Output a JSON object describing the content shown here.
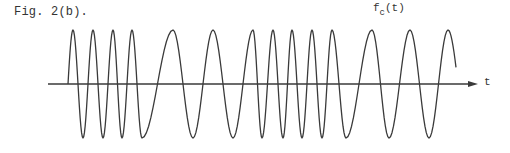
{
  "figure": {
    "caption": "Fig. 2(b).",
    "curve_label_main": "f",
    "curve_label_sub": "c",
    "curve_label_arg": "(t)",
    "axis_label": "t"
  },
  "chart_data": {
    "type": "line",
    "title": "Fig. 2(b).",
    "xlabel": "t",
    "ylabel": "",
    "series": [
      {
        "name": "f_c(t)",
        "description": "Frequency-modulated carrier: alternating fast and slow oscillations of constant amplitude",
        "start_point": [
          68,
          84
        ],
        "extrema_px": [
          [
            73,
            30
          ],
          [
            83,
            138
          ],
          [
            93,
            30
          ],
          [
            103,
            138
          ],
          [
            113,
            30
          ],
          [
            122,
            138
          ],
          [
            132,
            30
          ],
          [
            142,
            138
          ],
          [
            173,
            30
          ],
          [
            193,
            138
          ],
          [
            213,
            30
          ],
          [
            233,
            138
          ],
          [
            253,
            30
          ],
          [
            262,
            138
          ],
          [
            273,
            30
          ],
          [
            283,
            138
          ],
          [
            292,
            30
          ],
          [
            302,
            138
          ],
          [
            312,
            30
          ],
          [
            322,
            138
          ],
          [
            332,
            30
          ],
          [
            346,
            138
          ],
          [
            372,
            30
          ],
          [
            389,
            138
          ],
          [
            410,
            30
          ],
          [
            429,
            138
          ],
          [
            448,
            30
          ]
        ],
        "end_point": [
          456,
          40
        ]
      }
    ],
    "axis": {
      "x_start": 48,
      "x_end": 478,
      "y": 84,
      "arrow": true
    },
    "grid": false,
    "legend": "none"
  },
  "style": {
    "line_color": "#3a3a3a",
    "text_color": "#333333",
    "background": "#ffffff"
  }
}
